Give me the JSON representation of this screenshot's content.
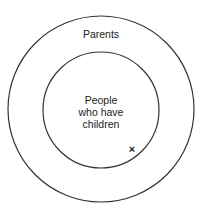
{
  "diagram": {
    "type": "euler-nested-circles",
    "outer": {
      "label": "Parents",
      "cx": 101,
      "cy": 109,
      "r": 93
    },
    "inner": {
      "label_lines": [
        "People",
        "who have",
        "children"
      ],
      "cx": 101,
      "cy": 110,
      "r": 58
    },
    "marker": {
      "symbol": "×",
      "x": 132,
      "y": 150
    },
    "stroke_color": "#333333"
  }
}
